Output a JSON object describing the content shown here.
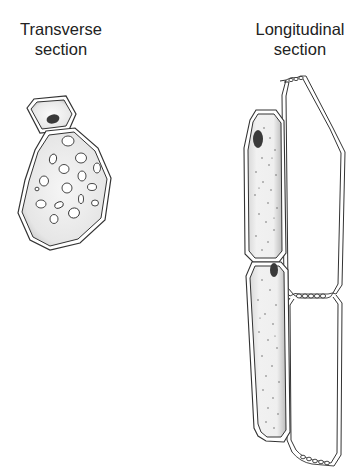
{
  "figure": {
    "type": "diagram",
    "panels": [
      {
        "id": "transverse",
        "title_line1": "Transverse",
        "title_line2": "section",
        "components": [
          "companion-cell",
          "sieve-tube-element",
          "sieve-plate-pores"
        ]
      },
      {
        "id": "longitudinal",
        "title_line1": "Longitudinal",
        "title_line2": "section",
        "components": [
          "companion-cell-upper",
          "companion-cell-lower",
          "sieve-tube-element-upper",
          "sieve-tube-element-lower",
          "sieve-plate-top",
          "sieve-plate-middle",
          "sieve-plate-bottom"
        ]
      }
    ],
    "colors": {
      "outline": "#333333",
      "cytoplasm": "#e9e9e9",
      "nucleus": "#444444",
      "background": "#ffffff"
    }
  }
}
